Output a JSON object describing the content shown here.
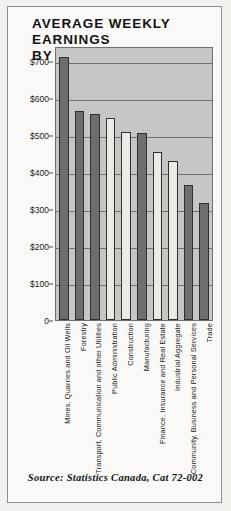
{
  "chart_data": {
    "type": "bar",
    "title": "AVERAGE WEEKLY EARNINGS\nBY INDUSTRY, 1986",
    "xlabel": "",
    "ylabel": "",
    "ylim": [
      0,
      740
    ],
    "grid": true,
    "legend": "none",
    "source": "Source: Statistics Canada, Cat 72-002",
    "ytick_labels": [
      "$700",
      "$600",
      "$500",
      "$400",
      "$300",
      "$200",
      "$100",
      "0"
    ],
    "ytick_values": [
      700,
      600,
      500,
      400,
      300,
      200,
      100,
      0
    ],
    "categories": [
      "Mines, Quarries and Oil Wells",
      "Forestry",
      "Transport, Communication and other Utilities",
      "Public Administration",
      "Construction",
      "Manufacturing",
      "Finance, Insurance and Real Estate",
      "Industrial Aggregate",
      "Community, Business and Personal Services",
      "Trade"
    ],
    "values": [
      710,
      565,
      557,
      545,
      508,
      505,
      453,
      430,
      365,
      316
    ],
    "bar_shades": [
      "dark",
      "dark",
      "dark",
      "light",
      "light",
      "dark",
      "light",
      "light",
      "dark",
      "dark"
    ],
    "colors": {
      "bar_dark": "#6e6e6c",
      "bar_light": "#eceae5",
      "bar_outline": "#2f2f2e",
      "plot_background": "#c6c6c4",
      "gridline": "#6f6f6d",
      "page_background": "#faf9f7",
      "text": "#141414"
    }
  }
}
